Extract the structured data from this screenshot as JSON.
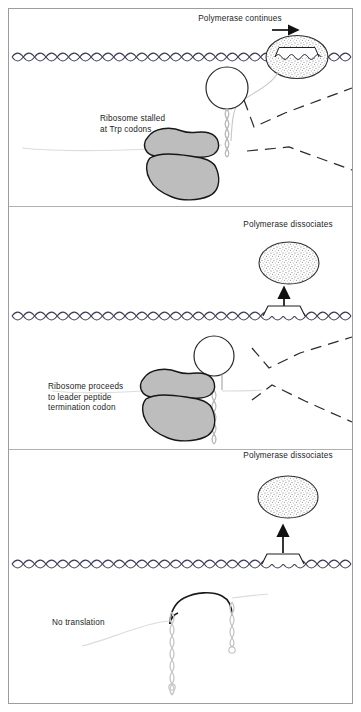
{
  "figure": {
    "width": 361,
    "height": 712,
    "background": "#ffffff",
    "frame_color": "#9a9a9a",
    "panel_divider_color": "#b5b5b5"
  },
  "colors": {
    "ink": "#1d1d1d",
    "dna": "#3a3a52",
    "ribosome_fill": "#b9b9b9",
    "ribosome_stroke": "#1a1a1a",
    "polymerase_fill": "#e9e9e9",
    "polymerase_stipple": "#6d6d6d",
    "polymerase_stroke": "#2a2a2a",
    "rna_light": "#c9c9c9",
    "leader_line": "#d0d0d0",
    "dashed_rna": "#2a2a2a"
  },
  "panels": [
    {
      "id": "panel-top",
      "index": 1,
      "top": 8,
      "bottom": 207,
      "labels": [
        {
          "name": "polymerase-continues-label",
          "text": "Polymerase continues",
          "x": 240,
          "y": 18,
          "anchor": "middle"
        },
        {
          "name": "ribosome-stalled-label",
          "lines": [
            "Ribosome stalled",
            "at Trp codons"
          ],
          "x": 100,
          "y": 118,
          "anchor": "start"
        }
      ],
      "icons": [
        {
          "name": "rightward-arrow-icon",
          "meaning": "transcription direction"
        },
        {
          "name": "rna-polymerase-icon",
          "meaning": "stippled ellipse on DNA with transcription bubble"
        },
        {
          "name": "ribosome-icon",
          "meaning": "two grey subunit blobs"
        },
        {
          "name": "mrna-hairpin-icon",
          "meaning": "loop 1:2 pause hairpin"
        },
        {
          "name": "dna-duplex-icon",
          "meaning": "double helix wavy line"
        }
      ]
    },
    {
      "id": "panel-middle",
      "index": 2,
      "top": 207,
      "bottom": 450,
      "labels": [
        {
          "name": "polymerase-dissociates-label",
          "text": "Polymerase dissociates",
          "x": 288,
          "y": 224,
          "anchor": "middle"
        },
        {
          "name": "ribosome-proceeds-label",
          "lines": [
            "Ribosome proceeds",
            "to leader peptide",
            "termination codon"
          ],
          "x": 48,
          "y": 385,
          "anchor": "start"
        }
      ],
      "icons": [
        {
          "name": "rna-polymerase-icon",
          "meaning": "released stippled ellipse"
        },
        {
          "name": "upward-arrow-icon",
          "meaning": "polymerase release"
        },
        {
          "name": "terminator-hairpin-icon",
          "meaning": "bracket on DNA"
        },
        {
          "name": "ribosome-icon",
          "meaning": "two grey subunit blobs"
        },
        {
          "name": "mrna-hairpin-icon",
          "meaning": "loop 3:4 terminator hairpin"
        },
        {
          "name": "dna-duplex-icon",
          "meaning": "double helix wavy line"
        }
      ]
    },
    {
      "id": "panel-bottom",
      "index": 3,
      "top": 450,
      "bottom": 704,
      "labels": [
        {
          "name": "polymerase-dissociates-label",
          "text": "Polymerase dissociates",
          "x": 288,
          "y": 455,
          "anchor": "middle"
        },
        {
          "name": "no-translation-label",
          "text": "No translation",
          "x": 52,
          "y": 622,
          "anchor": "start"
        }
      ],
      "icons": [
        {
          "name": "rna-polymerase-icon",
          "meaning": "released stippled ellipse"
        },
        {
          "name": "upward-arrow-icon",
          "meaning": "polymerase release"
        },
        {
          "name": "terminator-hairpin-icon",
          "meaning": "bracket on DNA"
        },
        {
          "name": "mrna-terminator-structure-icon",
          "meaning": "free 3:4 stem loop, no ribosome"
        },
        {
          "name": "dna-duplex-icon",
          "meaning": "double helix wavy line"
        }
      ]
    }
  ],
  "dna_lines": [
    {
      "name": "dna-line-panel1",
      "y": 57,
      "x1": 12,
      "x2": 352,
      "has_bubble": true,
      "bubble_x": 296
    },
    {
      "name": "dna-line-panel2",
      "y": 316,
      "x1": 12,
      "x2": 352,
      "has_terminator": true,
      "terminator_x": 283
    },
    {
      "name": "dna-line-panel3",
      "y": 564,
      "x1": 12,
      "x2": 352,
      "has_terminator": true,
      "terminator_x": 283
    }
  ]
}
